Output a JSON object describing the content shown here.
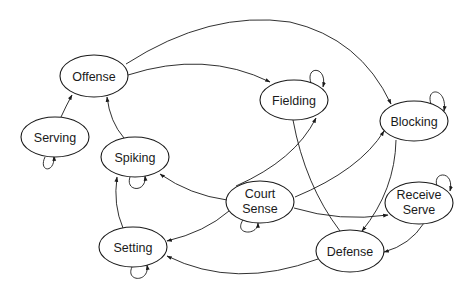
{
  "diagram": {
    "type": "state-transition-graph",
    "nodes": [
      {
        "id": "offense",
        "label": "Offense",
        "lines": [
          "Offense"
        ],
        "cx": 94,
        "cy": 76
      },
      {
        "id": "serving",
        "label": "Serving",
        "lines": [
          "Serving"
        ],
        "cx": 55,
        "cy": 137
      },
      {
        "id": "spiking",
        "label": "Spiking",
        "lines": [
          "Spiking"
        ],
        "cx": 135,
        "cy": 157
      },
      {
        "id": "setting",
        "label": "Setting",
        "lines": [
          "Setting"
        ],
        "cx": 133,
        "cy": 247
      },
      {
        "id": "court-sense",
        "label": "Court Sense",
        "lines": [
          "Court",
          "Sense"
        ],
        "cx": 260,
        "cy": 202
      },
      {
        "id": "fielding",
        "label": "Fielding",
        "lines": [
          "Fielding"
        ],
        "cx": 294,
        "cy": 100
      },
      {
        "id": "blocking",
        "label": "Blocking",
        "lines": [
          "Blocking"
        ],
        "cx": 414,
        "cy": 121
      },
      {
        "id": "receive-serve",
        "label": "Receive Serve",
        "lines": [
          "Receive",
          "Serve"
        ],
        "cx": 419,
        "cy": 203
      },
      {
        "id": "defense",
        "label": "Defense",
        "lines": [
          "Defense"
        ],
        "cx": 350,
        "cy": 251
      }
    ],
    "edges": [
      {
        "from": "serving",
        "to": "offense",
        "arrow": true
      },
      {
        "from": "spiking",
        "to": "offense",
        "arrow": true
      },
      {
        "from": "offense",
        "to": "fielding",
        "arrow": true
      },
      {
        "from": "offense",
        "to": "blocking",
        "arrow": true
      },
      {
        "from": "setting",
        "to": "spiking",
        "arrow": true
      },
      {
        "from": "court-sense",
        "to": "spiking",
        "arrow": true
      },
      {
        "from": "court-sense",
        "to": "setting",
        "arrow": true
      },
      {
        "from": "court-sense",
        "to": "fielding",
        "arrow": true
      },
      {
        "from": "court-sense",
        "to": "blocking",
        "arrow": true
      },
      {
        "from": "court-sense",
        "to": "receive-serve",
        "arrow": true
      },
      {
        "from": "fielding",
        "to": "defense",
        "arrow": false
      },
      {
        "from": "blocking",
        "to": "defense",
        "arrow": true
      },
      {
        "from": "receive-serve",
        "to": "defense",
        "arrow": true
      },
      {
        "from": "defense",
        "to": "setting",
        "arrow": true
      }
    ],
    "self_loops": [
      "serving",
      "spiking",
      "setting",
      "court-sense",
      "fielding",
      "blocking",
      "receive-serve"
    ]
  }
}
